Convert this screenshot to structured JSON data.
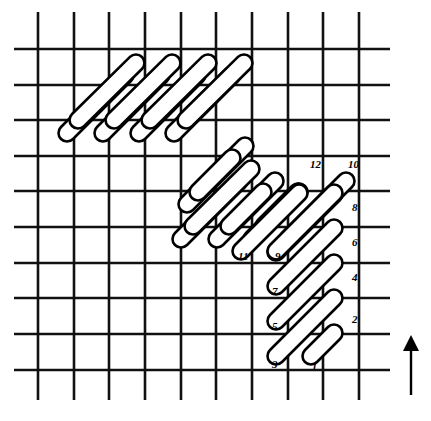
{
  "diagram": {
    "kind": "needlework-stitch-diagram",
    "canvas": {
      "width": 431,
      "height": 421,
      "background": "#ffffff"
    },
    "ink_color": "#000000",
    "stitch_fill": "#ffffff"
  },
  "grid": {
    "label": "canvas-mesh-grid",
    "vertical_count": 10,
    "horizontal_count": 10,
    "spacing_px": 35.7,
    "first_vertical_x": 38,
    "first_horizontal_y": 49,
    "line_width_px": 2.6,
    "vertical_x": [
      38,
      74,
      109,
      145,
      181,
      216,
      252,
      288,
      323,
      359
    ],
    "horizontal_y": [
      49,
      85,
      120,
      156,
      191,
      227,
      263,
      298,
      334,
      370
    ],
    "vertical_extent": {
      "top": 12,
      "bottom": 400
    },
    "horizontal_extent": {
      "left": 14,
      "right": 390
    }
  },
  "stitches": {
    "label": "satin-stitch-strokes",
    "angle_deg": -52,
    "width_px": 17,
    "groups": [
      {
        "name": "upper-left-band",
        "strokes": [
          {
            "x1": 61,
            "y1": 139,
            "x2": 131,
            "y2": 69
          },
          {
            "x1": 72,
            "y1": 126,
            "x2": 142,
            "y2": 57
          },
          {
            "x1": 97,
            "y1": 139,
            "x2": 167,
            "y2": 69
          },
          {
            "x1": 108,
            "y1": 126,
            "x2": 178,
            "y2": 57
          },
          {
            "x1": 133,
            "y1": 139,
            "x2": 203,
            "y2": 69
          },
          {
            "x1": 144,
            "y1": 126,
            "x2": 214,
            "y2": 57
          },
          {
            "x1": 168,
            "y1": 139,
            "x2": 238,
            "y2": 69
          },
          {
            "x1": 180,
            "y1": 126,
            "x2": 250,
            "y2": 57
          },
          {
            "x1": 181,
            "y1": 210,
            "x2": 251,
            "y2": 140
          },
          {
            "x1": 192,
            "y1": 198,
            "x2": 238,
            "y2": 152
          },
          {
            "x1": 175,
            "y1": 245,
            "x2": 245,
            "y2": 175
          },
          {
            "x1": 187,
            "y1": 232,
            "x2": 257,
            "y2": 163
          }
        ]
      },
      {
        "name": "middle-band",
        "strokes": [
          {
            "x1": 211,
            "y1": 245,
            "x2": 281,
            "y2": 175
          },
          {
            "x1": 223,
            "y1": 232,
            "x2": 269,
            "y2": 186
          },
          {
            "x1": 246,
            "y1": 245,
            "x2": 305,
            "y2": 186
          },
          {
            "x1": 258,
            "y1": 232,
            "x2": 304,
            "y2": 186
          },
          {
            "x1": 270,
            "y1": 258,
            "x2": 340,
            "y2": 188
          },
          {
            "x1": 282,
            "y1": 245,
            "x2": 352,
            "y2": 175
          }
        ]
      },
      {
        "name": "numbered-staircase",
        "strokes": [
          {
            "x1": 305,
            "y1": 362,
            "x2": 340,
            "y2": 327,
            "start": 1,
            "end": 2
          },
          {
            "x1": 270,
            "y1": 362,
            "x2": 340,
            "y2": 292,
            "start": 3,
            "end": 4
          },
          {
            "x1": 270,
            "y1": 327,
            "x2": 340,
            "y2": 257,
            "start": 5,
            "end": 6
          },
          {
            "x1": 270,
            "y1": 292,
            "x2": 340,
            "y2": 222,
            "start": 7,
            "end": 8
          },
          {
            "x1": 270,
            "y1": 257,
            "x2": 340,
            "y2": 187,
            "start": 9,
            "end": 10
          },
          {
            "x1": 235,
            "y1": 257,
            "x2": 305,
            "y2": 187,
            "start": 11,
            "end": 12
          }
        ]
      }
    ]
  },
  "labels": [
    {
      "id": "label-12",
      "text": "12",
      "x": 310,
      "y": 168
    },
    {
      "id": "label-10",
      "text": "10",
      "x": 348,
      "y": 168
    },
    {
      "id": "label-8",
      "text": "8",
      "x": 352,
      "y": 211
    },
    {
      "id": "label-6",
      "text": "6",
      "x": 352,
      "y": 246
    },
    {
      "id": "label-4",
      "text": "4",
      "x": 352,
      "y": 281
    },
    {
      "id": "label-2",
      "text": "2",
      "x": 352,
      "y": 323
    },
    {
      "id": "label-11",
      "text": "11",
      "x": 238,
      "y": 260
    },
    {
      "id": "label-9",
      "text": "9",
      "x": 275,
      "y": 260
    },
    {
      "id": "label-7",
      "text": "7",
      "x": 272,
      "y": 295
    },
    {
      "id": "label-5",
      "text": "5",
      "x": 272,
      "y": 330
    },
    {
      "id": "label-3",
      "text": "3",
      "x": 272,
      "y": 368
    },
    {
      "id": "label-1",
      "text": "l",
      "x": 313,
      "y": 370
    }
  ],
  "direction_arrow": {
    "name": "direction-arrow",
    "points_to": "up",
    "shaft": {
      "x": 411,
      "y_top": 340,
      "y_bottom": 395
    },
    "head": {
      "x": 411,
      "y": 335,
      "half_width": 8,
      "height": 16
    }
  }
}
